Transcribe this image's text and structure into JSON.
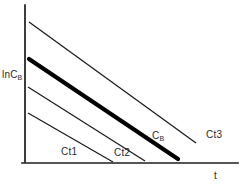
{
  "figure": {
    "name": "semilog-decay-plot",
    "background_color": "#ffffff",
    "ink_color": "#1a1a1a"
  },
  "axes": {
    "y": {
      "label_text": "lnC",
      "label_subscript": "B",
      "label_full": "lnCB"
    },
    "x": {
      "label_text": "t",
      "label_full": "t"
    }
  },
  "labels": {
    "ct1": "Ct1",
    "ct2": "Ct2",
    "cb_text": "C",
    "cb_subscript": "B",
    "cb_full": "CB",
    "ct3": "Ct3"
  },
  "chart_data": {
    "type": "line",
    "title": "",
    "xlabel": "t",
    "ylabel": "lnCB",
    "grid": false,
    "legend": "inline-annotations",
    "axis_origin_px": [
      25,
      163
    ],
    "xlim_px": [
      25,
      238
    ],
    "ylim_px": [
      163,
      5
    ],
    "series": [
      {
        "name": "Ct3",
        "style": "thin",
        "color": "#1a1a1a",
        "width_px": 1.25,
        "points_px": [
          [
            29,
            22
          ],
          [
            196,
            143
          ]
        ],
        "annotation": "Ct3",
        "annotation_px": [
          206,
          130
        ]
      },
      {
        "name": "CB",
        "style": "bold",
        "color": "#000000",
        "width_px": 4.2,
        "points_px": [
          [
            29,
            59
          ],
          [
            178,
            159
          ]
        ],
        "annotation": "CB",
        "annotation_px": [
          152,
          131
        ]
      },
      {
        "name": "Ct2",
        "style": "thin",
        "color": "#1a1a1a",
        "width_px": 1.25,
        "points_px": [
          [
            28,
            87
          ],
          [
            145,
            161
          ]
        ],
        "annotation": "Ct2",
        "annotation_px": [
          114,
          148
        ]
      },
      {
        "name": "Ct1",
        "style": "thin",
        "color": "#1a1a1a",
        "width_px": 1.25,
        "points_px": [
          [
            28,
            113
          ],
          [
            113,
            162
          ]
        ],
        "annotation": "Ct1",
        "annotation_px": [
          61,
          147
        ]
      }
    ]
  }
}
